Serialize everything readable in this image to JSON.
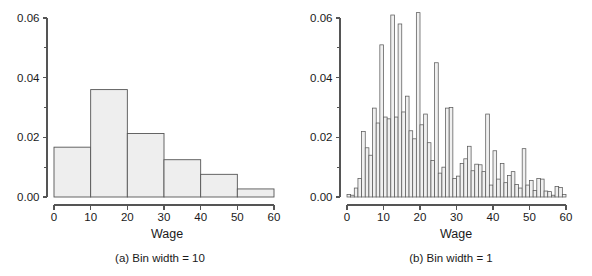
{
  "figure": {
    "background": "#ffffff",
    "bar_fill": "#eeeeee",
    "bar_stroke": "#555555",
    "axis_color": "#555555",
    "text_color": "#1a1a1a"
  },
  "panels": [
    {
      "id": "a",
      "caption": "(a) Bin width = 10",
      "xlabel": "Wage",
      "ylabel": "",
      "y_tick_labels": [
        "0.00",
        "0.02",
        "0.04",
        "0.06"
      ],
      "x_tick_labels": [
        "0",
        "10",
        "20",
        "30",
        "40",
        "50",
        "60"
      ]
    },
    {
      "id": "b",
      "caption": "(b) Bin width = 1",
      "xlabel": "Wage",
      "ylabel": "",
      "y_tick_labels": [
        "0.00",
        "0.02",
        "0.04",
        "0.06"
      ],
      "x_tick_labels": [
        "0",
        "10",
        "20",
        "30",
        "40",
        "50",
        "60"
      ]
    }
  ],
  "chart_data": [
    {
      "type": "bar",
      "id": "panel-a",
      "title": "(a) Bin width = 10",
      "xlabel": "Wage",
      "ylabel": "",
      "xlim": [
        0,
        60
      ],
      "ylim": [
        0.0,
        0.06
      ],
      "yticks": [
        0.0,
        0.02,
        0.04,
        0.06
      ],
      "yticks_minor": [
        0.01,
        0.03,
        0.05
      ],
      "xticks": [
        0,
        10,
        20,
        30,
        40,
        50,
        60
      ],
      "grid": false,
      "legend": "none",
      "bin_width": 10,
      "bin_edges": [
        0,
        10,
        20,
        30,
        40,
        50,
        60
      ],
      "categories": [
        "0-10",
        "10-20",
        "20-30",
        "30-40",
        "40-50",
        "50-60"
      ],
      "values": [
        0.0167,
        0.036,
        0.0213,
        0.0125,
        0.0076,
        0.0027
      ]
    },
    {
      "type": "bar",
      "id": "panel-b",
      "title": "(b) Bin width = 1",
      "xlabel": "Wage",
      "ylabel": "",
      "xlim": [
        0,
        60
      ],
      "ylim": [
        0.0,
        0.065
      ],
      "yticks": [
        0.0,
        0.02,
        0.04,
        0.06
      ],
      "yticks_minor": [
        0.01,
        0.03,
        0.05
      ],
      "xticks": [
        0,
        10,
        20,
        30,
        40,
        50,
        60
      ],
      "grid": false,
      "legend": "none",
      "bin_width": 1,
      "x": [
        0,
        1,
        2,
        3,
        4,
        5,
        6,
        7,
        8,
        9,
        10,
        11,
        12,
        13,
        14,
        15,
        16,
        17,
        18,
        19,
        20,
        21,
        22,
        23,
        24,
        25,
        26,
        27,
        28,
        29,
        30,
        31,
        32,
        33,
        34,
        35,
        36,
        37,
        38,
        39,
        40,
        41,
        42,
        43,
        44,
        45,
        46,
        47,
        48,
        49,
        50,
        51,
        52,
        53,
        54,
        55,
        56,
        57,
        58,
        59
      ],
      "values": [
        0.0008,
        0.0006,
        0.003,
        0.0062,
        0.022,
        0.0165,
        0.014,
        0.0298,
        0.0248,
        0.051,
        0.0268,
        0.0262,
        0.061,
        0.0268,
        0.058,
        0.0285,
        0.0338,
        0.0222,
        0.0195,
        0.0618,
        0.0242,
        0.0278,
        0.0182,
        0.0122,
        0.045,
        0.008,
        0.01,
        0.0298,
        0.03,
        0.0062,
        0.007,
        0.0112,
        0.0128,
        0.017,
        0.0088,
        0.011,
        0.0108,
        0.0085,
        0.0278,
        0.004,
        0.0155,
        0.006,
        0.0112,
        0.0048,
        0.0072,
        0.0085,
        0.0042,
        0.003,
        0.0162,
        0.004,
        0.0055,
        0.0022,
        0.0062,
        0.006,
        0.002,
        0.0018,
        0.0006,
        0.0035,
        0.0032,
        0.0008
      ]
    }
  ]
}
